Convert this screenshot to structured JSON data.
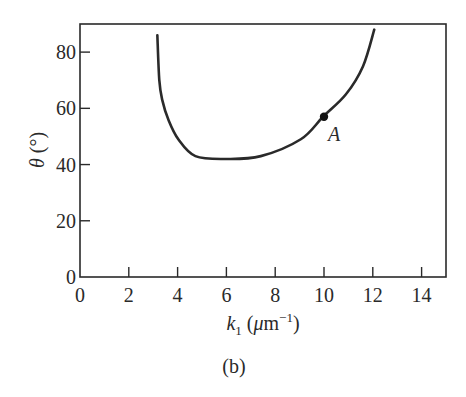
{
  "chart_data": {
    "type": "line",
    "title": "",
    "caption": "(b)",
    "xlabel": "k1 (μm⁻¹)",
    "xlabel_parts": {
      "symbol": "k",
      "subscript": "1",
      "unit_open": " (",
      "mu": "μ",
      "unit": "m",
      "exp": "−1",
      "unit_close": ")"
    },
    "ylabel": "θ (°)",
    "xlim": [
      0,
      15
    ],
    "ylim": [
      0,
      90
    ],
    "xticks": [
      0,
      2,
      4,
      6,
      8,
      10,
      12,
      14
    ],
    "yticks": [
      0,
      20,
      40,
      60,
      80
    ],
    "grid": false,
    "legend": null,
    "series": [
      {
        "name": "θ vs k1",
        "color": "#2a2a2a",
        "x": [
          3.17,
          3.25,
          3.37,
          3.62,
          4.03,
          4.73,
          5.97,
          7.41,
          9.05,
          9.96,
          10.9,
          11.6,
          12.06
        ],
        "y": [
          86,
          70,
          63,
          56,
          49,
          43,
          42,
          43,
          49,
          57,
          65,
          75,
          88
        ]
      }
    ],
    "annotations": [
      {
        "label": "A",
        "x": 10,
        "y": 57,
        "marker": "filled-circle"
      }
    ]
  }
}
